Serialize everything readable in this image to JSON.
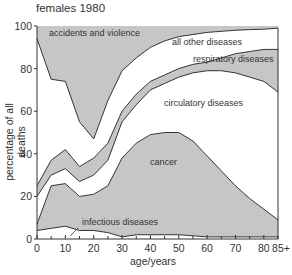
{
  "chart_data": {
    "type": "area",
    "title": "females 1980",
    "xlabel": "age/years",
    "ylabel": "percentage of all deaths",
    "xlim": [
      0,
      85
    ],
    "ylim": [
      0,
      100
    ],
    "x_ticks": [
      0,
      10,
      20,
      30,
      40,
      50,
      60,
      70,
      80,
      85
    ],
    "x_tick_labels": [
      "0",
      "10",
      "20",
      "30",
      "40",
      "50",
      "60",
      "70",
      "80",
      "85+"
    ],
    "y_ticks": [
      0,
      20,
      40,
      60,
      80,
      100
    ],
    "y_tick_labels": [
      "0",
      "20",
      "40",
      "60",
      "80",
      "100"
    ],
    "grid": false,
    "legend": "inline labels",
    "x": [
      0,
      5,
      10,
      15,
      20,
      25,
      30,
      35,
      40,
      45,
      50,
      55,
      60,
      65,
      70,
      75,
      80,
      85
    ],
    "boundaries": [
      {
        "name": "infectious diseases (upper edge)",
        "values": [
          4,
          5,
          6,
          4,
          4,
          3,
          1,
          2,
          2,
          2,
          2,
          1.5,
          1,
          1,
          1,
          1,
          1,
          1
        ]
      },
      {
        "name": "cancer (upper edge)",
        "values": [
          7,
          25,
          26,
          20,
          21,
          25,
          38,
          45,
          49,
          50,
          50,
          46,
          39,
          32,
          25,
          19,
          14,
          9
        ]
      },
      {
        "name": "circulatory diseases (upper edge)",
        "values": [
          20,
          30,
          33,
          27,
          30,
          37,
          55,
          63,
          70,
          73,
          76,
          78,
          79,
          79,
          78,
          76,
          74,
          69
        ]
      },
      {
        "name": "respiratory diseases (upper edge)",
        "values": [
          25,
          37,
          42,
          34,
          38,
          45,
          60,
          68,
          74,
          77,
          80,
          82,
          83,
          85,
          87,
          88,
          89,
          89
        ]
      },
      {
        "name": "all other diseases (upper edge)",
        "values": [
          94,
          75,
          74,
          55,
          47,
          65,
          79,
          85,
          90,
          93,
          95,
          96,
          97,
          97.5,
          98,
          98.3,
          98.5,
          99
        ]
      },
      {
        "name": "accidents and violence (upper edge)",
        "values": [
          100,
          100,
          100,
          100,
          100,
          100,
          100,
          100,
          100,
          100,
          100,
          100,
          100,
          100,
          100,
          100,
          100,
          100
        ]
      }
    ],
    "series": [
      {
        "name": "infectious diseases",
        "shade": "white"
      },
      {
        "name": "cancer",
        "shade": "gray"
      },
      {
        "name": "circulatory diseases",
        "shade": "white"
      },
      {
        "name": "respiratory diseases",
        "shade": "gray"
      },
      {
        "name": "all other diseases",
        "shade": "white"
      },
      {
        "name": "accidents and violence",
        "shade": "gray"
      }
    ],
    "labels": {
      "accidents": "accidents and violence",
      "other": "all other diseases",
      "respiratory": "respiratory diseases",
      "circulatory": "circulatory diseases",
      "cancer": "cancer",
      "infectious": "infectious diseases"
    },
    "colors": {
      "gray": "#c6c6c6",
      "white": "#ffffff",
      "line": "#333333"
    }
  }
}
